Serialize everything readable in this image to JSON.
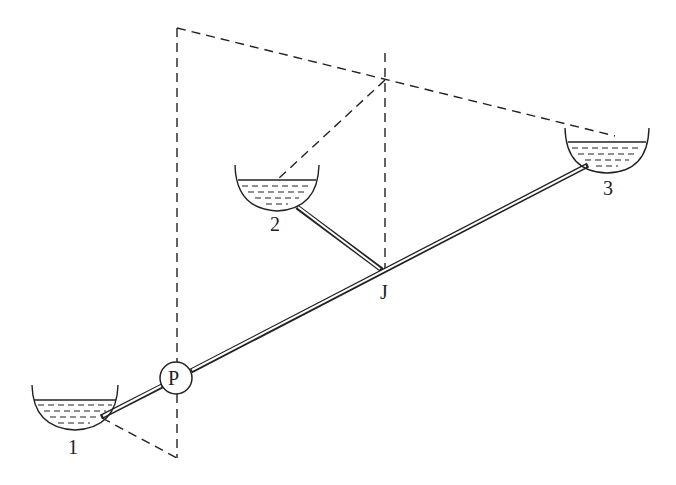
{
  "diagram": {
    "colors": {
      "line": "#222222",
      "background": "#ffffff"
    },
    "nodes": [
      {
        "id": "reservoir-1",
        "label": "1",
        "type": "reservoir",
        "x": 75,
        "y": 392
      },
      {
        "id": "reservoir-2",
        "label": "2",
        "type": "reservoir",
        "x": 272,
        "y": 178
      },
      {
        "id": "reservoir-3",
        "label": "3",
        "type": "reservoir",
        "x": 604,
        "y": 142
      },
      {
        "id": "pump",
        "label": "P",
        "type": "pump",
        "x": 176,
        "y": 378
      },
      {
        "id": "junction",
        "label": "J",
        "type": "junction",
        "x": 383,
        "y": 272
      }
    ],
    "edges": [
      {
        "from": "reservoir-1",
        "to": "pump",
        "style": "pipe"
      },
      {
        "from": "pump",
        "to": "junction",
        "style": "pipe"
      },
      {
        "from": "junction",
        "to": "reservoir-3",
        "style": "pipe"
      },
      {
        "from": "reservoir-2",
        "to": "junction",
        "style": "pipe"
      },
      {
        "from": "hgl-top-left",
        "to": "reservoir-3",
        "style": "dashed",
        "note": "hydraulic grade line"
      },
      {
        "from": "junction-hgl",
        "to": "reservoir-2",
        "style": "dashed"
      },
      {
        "from": "reservoir-1",
        "to": "pump-base",
        "style": "dashed"
      }
    ],
    "labels": {
      "r1": "1",
      "r2": "2",
      "r3": "3",
      "pump": "P",
      "junction": "J"
    }
  }
}
